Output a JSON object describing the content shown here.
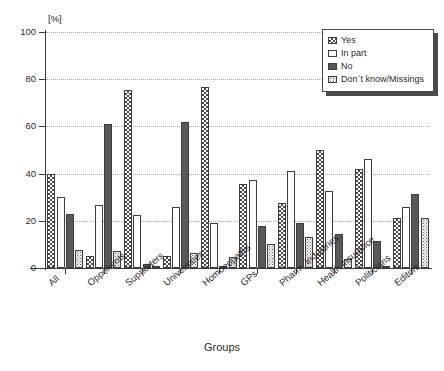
{
  "chart_data": {
    "type": "bar",
    "title": "",
    "xlabel": "Groups",
    "ylabel": "[%]",
    "ylim": [
      0,
      100
    ],
    "yticks": [
      0,
      20,
      40,
      60,
      80,
      100
    ],
    "grid": true,
    "legend_position": "top-right",
    "categories": [
      "All",
      "Opponents",
      "Supporters",
      "Universities",
      "Homoeopaths",
      "GPs",
      "Pharm. industries",
      "Health insurance",
      "Politicians",
      "Editors"
    ],
    "series": [
      {
        "name": "Yes",
        "pattern": "crosshatch",
        "values": [
          40,
          5,
          75.5,
          5,
          76.5,
          35.5,
          27.5,
          50,
          42,
          21
        ]
      },
      {
        "name": "In part",
        "pattern": "empty",
        "values": [
          30,
          26.5,
          22.5,
          26,
          19,
          37.5,
          41,
          32.5,
          46,
          26
        ]
      },
      {
        "name": "No",
        "pattern": "solid",
        "values": [
          23,
          61,
          1.5,
          62,
          0.5,
          18,
          19,
          14.5,
          11.5,
          31.5
        ]
      },
      {
        "name": "Don´t know/Missings",
        "pattern": "stipple",
        "values": [
          7.5,
          7,
          0.5,
          6.5,
          4.5,
          10,
          13,
          4,
          0.5,
          21
        ]
      }
    ]
  },
  "legend": {
    "items": [
      {
        "label": "Yes"
      },
      {
        "label": "In part"
      },
      {
        "label": "No"
      },
      {
        "label": "Don´t know/Missings"
      }
    ]
  },
  "axes": {
    "y_unit": "[%]",
    "y_tick_labels": [
      "0",
      "20",
      "40",
      "60",
      "80",
      "100"
    ],
    "x_title": "Groups"
  }
}
